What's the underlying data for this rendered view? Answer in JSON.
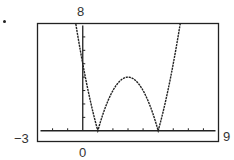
{
  "chart_data": {
    "type": "line",
    "title": "",
    "xlabel": "",
    "ylabel": "",
    "function": "y = |x^2 - 6x + 5|",
    "xlim": [
      -3,
      9
    ],
    "ylim": [
      -0.8,
      8
    ],
    "grid": false,
    "legend": null,
    "tick_labels": {
      "ymax": "8",
      "xmin": "-3",
      "xmax": "9",
      "x_origin": "0"
    },
    "x_tick_step": 1,
    "y_tick_step": 1,
    "series": [
      {
        "name": "f(x)",
        "x": [
          -0.3,
          0,
          0.5,
          1,
          1.5,
          2,
          2.5,
          3,
          3.5,
          4,
          4.5,
          5,
          5.5,
          6,
          6.5,
          6.7
        ],
        "values": [
          6.89,
          5,
          2.25,
          0,
          1.75,
          3,
          3.75,
          4,
          3.75,
          3,
          1.75,
          0,
          2.25,
          5,
          8.25,
          9.09
        ]
      }
    ],
    "annotations": [
      "zeros at x=1 and x=5",
      "local max at (3, 4)"
    ]
  },
  "labels": {
    "ymax": "8",
    "xmin": "−3",
    "xmax": "9",
    "x_origin": "0"
  }
}
